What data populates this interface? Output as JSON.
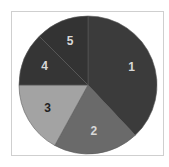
{
  "chart_data": {
    "type": "pie",
    "title": "",
    "categories": [
      "1",
      "2",
      "3",
      "4",
      "5"
    ],
    "values": [
      38,
      20,
      17,
      12.5,
      12.5
    ],
    "colors": [
      "#3b3b3b",
      "#6a6a6a",
      "#a3a3a3",
      "#353535",
      "#333333"
    ],
    "label_colors": [
      "#d8d8d8",
      "#d8d8d8",
      "#222222",
      "#d8d8d8",
      "#d8d8d8"
    ],
    "start_angle_deg": 0,
    "direction": "clockwise",
    "legend": "none"
  }
}
